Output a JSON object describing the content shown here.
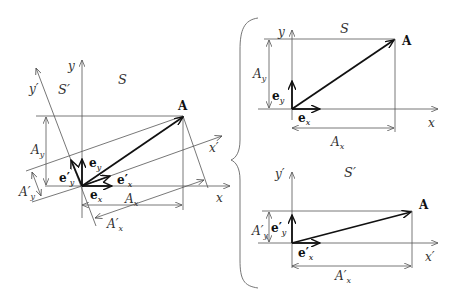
{
  "diagram": {
    "left_panel": {
      "frame_S_label": "S",
      "frame_S_prime_label": "S′",
      "x_axis_label": "x",
      "y_axis_label": "y",
      "x_prime_axis_label": "x′",
      "y_prime_axis_label": "y′",
      "vector_label": "A",
      "e_x": "e",
      "e_x_sub": "x",
      "e_y": "e",
      "e_y_sub": "y",
      "e_x_prime": "e′",
      "e_x_prime_sub": "x",
      "e_y_prime": "e′",
      "e_y_prime_sub": "y",
      "A_x": "A",
      "A_x_sub": "x",
      "A_y": "A",
      "A_y_sub": "y",
      "A_x_prime": "A′",
      "A_x_prime_sub": "x",
      "A_y_prime": "A′",
      "A_y_prime_sub": "y"
    },
    "right_top_panel": {
      "frame_label": "S",
      "x_axis_label": "x",
      "y_axis_label": "y",
      "vector_label": "A",
      "e_x": "e",
      "e_x_sub": "x",
      "e_y": "e",
      "e_y_sub": "y",
      "A_x": "A",
      "A_x_sub": "x",
      "A_y": "A",
      "A_y_sub": "y"
    },
    "right_bottom_panel": {
      "frame_label": "S′",
      "x_axis_label": "x′",
      "y_axis_label": "y′",
      "vector_label": "A",
      "e_x": "e′",
      "e_x_sub": "x",
      "e_y": "e′",
      "e_y_sub": "y",
      "A_x": "A′",
      "A_x_sub": "x",
      "A_y": "A′",
      "A_y_sub": "y"
    },
    "colors": {
      "line": "#555555",
      "vector": "#111111",
      "text": "#333333"
    }
  }
}
